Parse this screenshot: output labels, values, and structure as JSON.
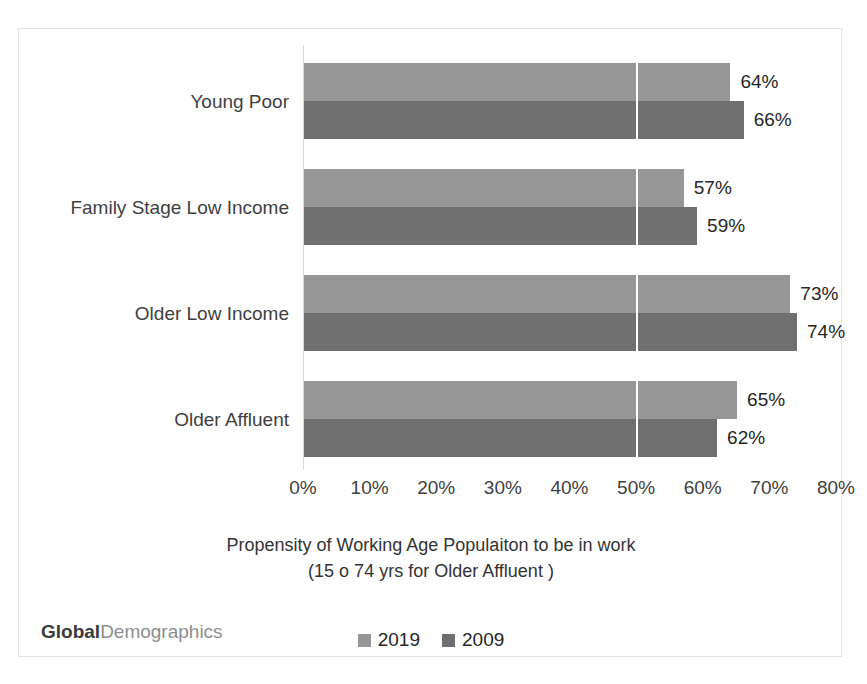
{
  "watermark": {
    "bold_text": "Global",
    "light_text": "Demographics"
  },
  "colors": {
    "series_2019": "#969696",
    "series_2009": "#6f6f6f",
    "frame_border": "#e2e2e2",
    "gridline": "#ffffff",
    "axis_line": "#d9d9d9",
    "label_text": "#262626"
  },
  "chart_data": {
    "type": "bar",
    "orientation": "horizontal",
    "title": "Propensity of Working Age Populaiton to be in work (15 o 74 yrs for Older Affluent )",
    "title_lines": [
      "Propensity of Working Age Populaiton to be in work",
      "(15 o 74 yrs for Older Affluent )"
    ],
    "xlabel": "",
    "ylabel": "",
    "xlim": [
      0,
      80
    ],
    "ylim": null,
    "grid": "single vertical white gridline at 50%",
    "gridline_values": [
      50
    ],
    "legend_position": "bottom-center",
    "categories": [
      "Young Poor",
      "Family Stage Low Income",
      "Older Low Income",
      "Older Affluent"
    ],
    "xticks": [
      0,
      10,
      20,
      30,
      40,
      50,
      60,
      70,
      80
    ],
    "xtick_labels": [
      "0%",
      "10%",
      "20%",
      "30%",
      "40%",
      "50%",
      "60%",
      "70%",
      "80%"
    ],
    "series": [
      {
        "name": "2019",
        "color": "#969696",
        "values": [
          64,
          57,
          73,
          65
        ],
        "data_labels": [
          "64%",
          "57%",
          "73%",
          "65%"
        ]
      },
      {
        "name": "2009",
        "color": "#6f6f6f",
        "values": [
          66,
          59,
          74,
          62
        ],
        "data_labels": [
          "66%",
          "59%",
          "74%",
          "62%"
        ]
      }
    ]
  }
}
